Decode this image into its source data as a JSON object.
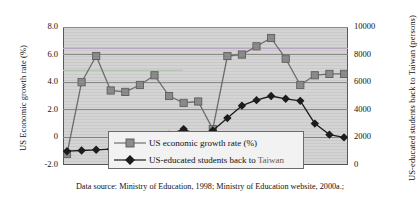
{
  "chart_data": {
    "type": "line",
    "title": "",
    "xlabel": "",
    "ylabel": "US Economic growth rate (%)",
    "y2label": "US-educated students back to Taiwan (persons)",
    "grid": true,
    "legend_position": "inside-bottom-center",
    "ylim": [
      -2.0,
      8.0
    ],
    "y2lim": [
      0,
      10000
    ],
    "yticks": [
      "8.0",
      "6.0",
      "4.0",
      "2.0",
      "0",
      "-2.0"
    ],
    "ytick_values": [
      8.0,
      6.0,
      4.0,
      2.0,
      0,
      -2.0
    ],
    "y2ticks": [
      "10000",
      "8000",
      "6000",
      "4000",
      "2000",
      "0"
    ],
    "y2tick_values": [
      10000,
      8000,
      6000,
      4000,
      2000,
      0
    ],
    "xticks": [],
    "x": [
      1,
      2,
      3,
      4,
      5,
      6,
      7,
      8,
      9,
      10,
      11,
      12,
      13,
      14,
      15,
      16,
      17,
      18,
      19,
      20
    ],
    "series": [
      {
        "name": "US economic growth rate (%)",
        "axis": "left",
        "marker": "square",
        "color": "#8c8c8c",
        "line_color": "#6e6e6e",
        "values": [
          -1.2,
          4.0,
          5.9,
          3.4,
          3.3,
          3.8,
          4.5,
          3.0,
          2.5,
          2.6,
          0.6,
          5.9,
          6.0,
          6.6,
          7.2,
          5.7,
          3.8,
          4.5,
          4.6,
          4.6
        ]
      },
      {
        "name": "US-educated students back to Taiwan",
        "axis": "right",
        "marker": "diamond",
        "color": "#1c1c1c",
        "line_color": "#1c1c1c",
        "values": [
          1000,
          1050,
          1100,
          1150,
          1300,
          1550,
          1850,
          2200,
          2600,
          2150,
          2500,
          3400,
          4300,
          4700,
          5000,
          4800,
          4650,
          3000,
          2200,
          2000
        ]
      }
    ]
  },
  "axes": {
    "left_title": "US Economic growth rate (%)",
    "right_title": "US-educated students back to Taiwan (persons)"
  },
  "legend": {
    "items": [
      {
        "label": "US economic growth rate (%)",
        "marker": "square"
      },
      {
        "label_plain": "US-educated students back to ",
        "label_accent": "Taiwan",
        "marker": "diamond"
      }
    ]
  },
  "caption": {
    "text": "Data source: Ministry of Education, 1998; Ministry of Education website, 2000a.;"
  },
  "colors": {
    "plot_background": "#d4d4d4",
    "gridline": "#8a8a8a",
    "axis_border": "#5a5a5a",
    "series_1": "#8c8c8c",
    "series_2": "#1c1c1c",
    "accent_text": "#6a5a52",
    "tint_line_purple": "#b9a8c4",
    "tint_line_green": "#b4c4ae"
  }
}
